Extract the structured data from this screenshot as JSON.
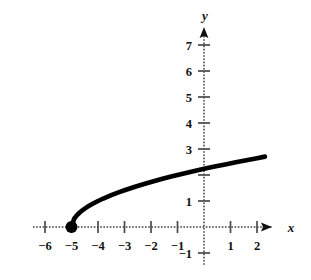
{
  "figure": {
    "background_color": "#ffffff",
    "curve_color": "#000000",
    "axis_color": "#6e6e6e",
    "text_color": "#111111",
    "axis_labels": {
      "x": "x",
      "y": "y"
    }
  },
  "chart_data": {
    "type": "line",
    "title": "",
    "xlabel": "x",
    "ylabel": "y",
    "grid": false,
    "legend": "none",
    "xlim": [
      -6.6,
      2.8
    ],
    "ylim": [
      -1.6,
      7.9
    ],
    "xticks": [
      -6,
      -5,
      -4,
      -3,
      -2,
      -1,
      1,
      2
    ],
    "yticks": [
      1,
      2,
      3,
      4,
      5,
      6,
      7,
      -1
    ],
    "xtick_labels": [
      "−6",
      "−5",
      "−4",
      "−3",
      "−2",
      "−1",
      "1",
      "2"
    ],
    "ytick_labels_visible": [
      "7",
      "6",
      "5",
      "4",
      "3",
      "1",
      "−1"
    ],
    "ytick_label_hidden_by_curve": "2",
    "equation": "y = √(x + 5)",
    "domain": [
      -5,
      2.3
    ],
    "endpoint": {
      "x": -5,
      "y": 0,
      "style": "filled-circle",
      "closed": true
    },
    "series": [
      {
        "name": "y = sqrt(x+5)",
        "x": [
          -5,
          -4.9,
          -4.8,
          -4.7,
          -4.6,
          -4.5,
          -4.4,
          -4.2,
          -4,
          -3.8,
          -3.5,
          -3.2,
          -3,
          -2.6,
          -2.2,
          -2,
          -1.6,
          -1.2,
          -1,
          -0.6,
          -0.2,
          0,
          0.4,
          0.8,
          1.2,
          1.6,
          2,
          2.3
        ],
        "y": [
          0,
          0.316,
          0.447,
          0.548,
          0.632,
          0.707,
          0.775,
          0.894,
          1,
          1.095,
          1.225,
          1.342,
          1.414,
          1.549,
          1.673,
          1.732,
          1.844,
          1.949,
          2,
          2.098,
          2.191,
          2.236,
          2.324,
          2.408,
          2.49,
          2.569,
          2.646,
          2.707
        ]
      }
    ]
  }
}
